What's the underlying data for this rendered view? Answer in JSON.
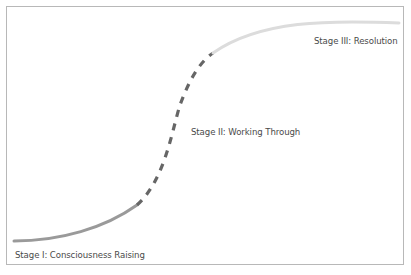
{
  "diagram": {
    "type": "s-curve",
    "stages": [
      {
        "label": "Stage I: Consciousness Raising",
        "style": "solid",
        "color": "#9a9a9a"
      },
      {
        "label": "Stage II: Working Through",
        "style": "dashed",
        "color": "#666666"
      },
      {
        "label": "Stage III: Resolution",
        "style": "solid",
        "color": "#dcdcdc"
      }
    ],
    "frame_color": "#b8b8b8"
  }
}
